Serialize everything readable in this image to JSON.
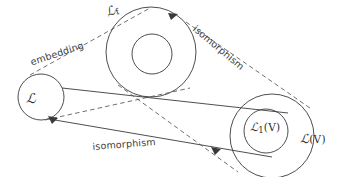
{
  "diagram": {
    "background_color": "#ffffff",
    "stroke_color": "#3a3a3a",
    "dashed_stroke_color": "#555555",
    "nodes": {
      "left_circle": {
        "label_plain": "L",
        "label_script": "ℒ",
        "cx": 41,
        "cy": 97,
        "r": 23
      },
      "top_annulus": {
        "label_plain": "L_f",
        "label_script": "ℒ",
        "label_subscript": "f",
        "cx": 151,
        "cy": 52,
        "r_outer": 45,
        "r_inner": 20
      },
      "bottom_right_annulus": {
        "outer_label_script": "ℒ",
        "outer_label_paren": "(V)",
        "outer_label_plain": "L(V)",
        "inner_label_script": "ℒ",
        "inner_label_subscript": "1",
        "inner_label_paren": "(V)",
        "inner_label_plain": "L_1(V)",
        "cx": 272,
        "cy": 136,
        "r_outer": 42,
        "r_inner": 22
      }
    },
    "edges": [
      {
        "name": "embedding",
        "label": "embedding",
        "style": "dashed",
        "from": "left_circle",
        "to": "top_annulus"
      },
      {
        "name": "isomorphism-top",
        "label": "isomorphism",
        "style": "dashed",
        "from": "top_annulus",
        "to": "bottom_right_annulus"
      },
      {
        "name": "isomorphism-bottom",
        "label": "isomorphism",
        "style": "solid",
        "from": "left_circle",
        "to": "bottom_right_annulus"
      }
    ]
  },
  "labels": {
    "embedding": "embedding",
    "isomorphism_top": "isomorphism",
    "isomorphism_bottom": "isomorphism",
    "l_script": "ℒ",
    "l_top_script": "ℒ",
    "l_top_subscript": "f",
    "lv_script": "ℒ",
    "lv_paren": "(V)",
    "l1v_script": "ℒ",
    "l1v_subscript": "1",
    "l1v_paren": "(V)"
  }
}
